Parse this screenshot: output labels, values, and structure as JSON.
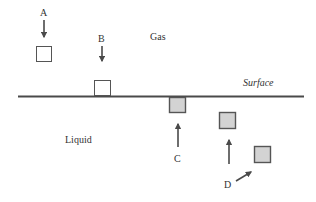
{
  "diagram": {
    "title": "",
    "colors": {
      "line": "#4a4a4a",
      "open_box_fill": "#ffffff",
      "open_box_stroke": "#555555",
      "filled_box_fill": "#d3d3d3",
      "filled_box_stroke": "#555555",
      "text": "#333333"
    },
    "regions": {
      "gas": "Gas",
      "liquid": "Liquid",
      "surface": "Surface"
    },
    "markers": [
      {
        "id": "A",
        "label": "A",
        "position": "in gas, above surface",
        "arrow": "down"
      },
      {
        "id": "B",
        "label": "B",
        "position": "resting on surface, gas side",
        "arrow": "down"
      },
      {
        "id": "C",
        "label": "C",
        "position": "just below surface, liquid side",
        "arrow": "up"
      },
      {
        "id": "D",
        "label": "D",
        "position": "deeper in liquid",
        "arrow": "up-right"
      }
    ]
  }
}
